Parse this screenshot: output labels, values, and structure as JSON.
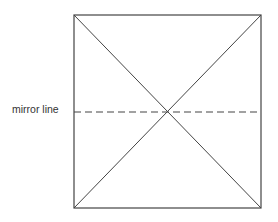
{
  "diagram": {
    "label": "mirror line",
    "shape": "square",
    "square": {
      "x1": 74,
      "y1": 15,
      "x2": 261,
      "y2": 208
    },
    "mirror_line_y": 112,
    "colors": {
      "stroke": "#444444",
      "background": "#ffffff"
    }
  }
}
